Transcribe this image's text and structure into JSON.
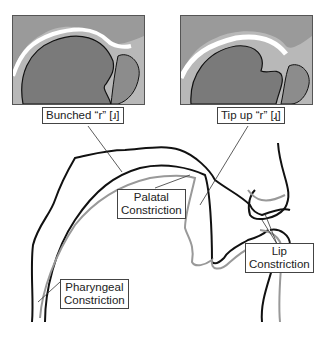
{
  "panels": [
    {
      "name": "mri-bunched-r",
      "caption": "Bunched “r” [ɹ]"
    },
    {
      "name": "mri-tip-up-r",
      "caption": "Tip up “r” [ɻ]"
    }
  ],
  "labels": {
    "palatal_line1": "Palatal",
    "palatal_line2": "Constriction",
    "pharyngeal_line1": "Pharyngeal",
    "pharyngeal_line2": "Constriction",
    "lip_line1": "Lip",
    "lip_line2": "Constriction"
  },
  "colors": {
    "bunched_outline": "#1a1a1a",
    "tip_up_outline": "#9a9a9a",
    "tissue": "#808080"
  }
}
